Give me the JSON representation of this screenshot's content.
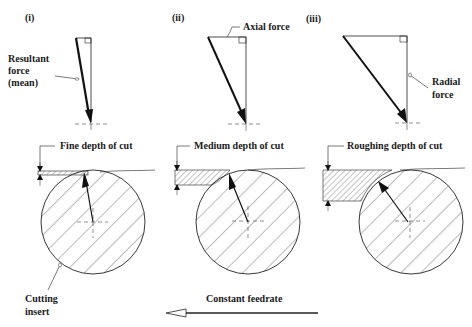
{
  "panels": [
    {
      "id": "i",
      "label": "(i)",
      "depth_label": "Fine depth of cut",
      "force_label": "Resultant force (mean)",
      "force_label_lines": [
        "Resultant",
        "force",
        "(mean)"
      ]
    },
    {
      "id": "ii",
      "label": "(ii)",
      "depth_label": "Medium depth of cut",
      "force_label": "Axial force"
    },
    {
      "id": "iii",
      "label": "(iii)",
      "depth_label": "Roughing depth of cut",
      "force_label": "Radial force",
      "force_label_lines": [
        "Radial",
        "force"
      ]
    }
  ],
  "insert_label_lines": [
    "Cutting",
    "insert"
  ],
  "feed_label": "Constant feedrate",
  "colors": {
    "line": "#222222",
    "hatch": "#555555",
    "background": "#ffffff"
  }
}
